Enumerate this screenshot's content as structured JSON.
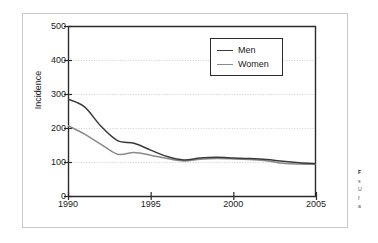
{
  "figure": {
    "background_color": "#ffffff",
    "frame_color": "#c9c9c9"
  },
  "caption": {
    "lines": [
      "F",
      "s",
      "U",
      "f",
      "a"
    ]
  },
  "chart_data": {
    "type": "line",
    "title": "",
    "subtitle": "",
    "xlabel": "",
    "ylabel": "Incidence",
    "xlim": [
      1990,
      2005
    ],
    "ylim": [
      0,
      500
    ],
    "xticks": [
      1990,
      1995,
      2000,
      2005
    ],
    "xtick_labels": [
      "1990",
      "1995",
      "2000",
      "2005"
    ],
    "yticks": [
      0,
      100,
      200,
      300,
      400,
      500
    ],
    "ytick_labels": [
      "0",
      "100",
      "200",
      "300",
      "400",
      "500"
    ],
    "grid": "horizontal-dotted",
    "grid_color": "#d0d0d0",
    "legend_position": "upper-center-right",
    "x": [
      1990,
      1991,
      1992,
      1993,
      1994,
      1995,
      1996,
      1997,
      1998,
      1999,
      2000,
      2001,
      2002,
      2003,
      2004,
      2005
    ],
    "series": [
      {
        "name": "Men",
        "color": "#3a3a3a",
        "values": [
          285,
          262,
          205,
          163,
          155,
          135,
          116,
          106,
          112,
          114,
          112,
          110,
          107,
          102,
          98,
          95
        ]
      },
      {
        "name": "Women",
        "color": "#8a8a8a",
        "values": [
          207,
          182,
          152,
          123,
          128,
          120,
          110,
          103,
          108,
          110,
          109,
          107,
          104,
          96,
          94,
          93
        ]
      }
    ]
  }
}
